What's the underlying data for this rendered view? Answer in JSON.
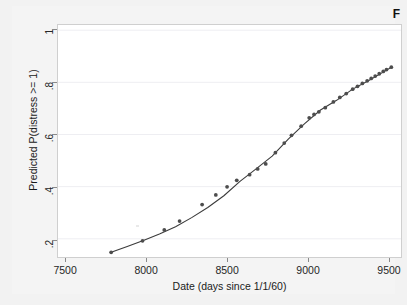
{
  "figure": {
    "background_color": "#f2f2f2",
    "plot_background_color": "#ffffff",
    "corner_glyph": "F"
  },
  "chart_data": {
    "type": "line",
    "title": "",
    "subtitle": "",
    "xlabel": "Date (days since 1/1/60)",
    "ylabel": "Predicted P(distress >= 1)",
    "xlim": [
      7450,
      9580
    ],
    "ylim": [
      0.13,
      1.02
    ],
    "xticks": [
      7500,
      8000,
      8500,
      9000,
      9500
    ],
    "xtick_labels": [
      "7500",
      "8000",
      "8500",
      "9000",
      "9500"
    ],
    "yticks": [
      0.2,
      0.4,
      0.6,
      0.8,
      1.0
    ],
    "ytick_labels": [
      ".2",
      ".4",
      ".6",
      ".8",
      "1"
    ],
    "grid": "horizontal",
    "grid_color": "#eeeef2",
    "legend": "none",
    "marker": "circle",
    "marker_color": "#4d4d4d",
    "line_color": "#3b3b3b",
    "series": [
      {
        "name": "Predicted P(distress >= 1)",
        "x": [
          7780,
          7975,
          8110,
          8205,
          8345,
          8430,
          8500,
          8560,
          8640,
          8690,
          8740,
          8800,
          8855,
          8900,
          8960,
          9010,
          9040,
          9070,
          9110,
          9160,
          9200,
          9240,
          9280,
          9310,
          9340,
          9370,
          9395,
          9420,
          9445,
          9470,
          9490,
          9520
        ],
        "y": [
          0.148,
          0.192,
          0.234,
          0.268,
          0.331,
          0.368,
          0.399,
          0.424,
          0.446,
          0.468,
          0.487,
          0.53,
          0.567,
          0.597,
          0.632,
          0.664,
          0.677,
          0.687,
          0.703,
          0.725,
          0.742,
          0.757,
          0.774,
          0.785,
          0.796,
          0.806,
          0.815,
          0.824,
          0.833,
          0.842,
          0.849,
          0.858
        ]
      }
    ],
    "fit_curve": {
      "name": "logistic fit",
      "x": [
        7780,
        7880,
        7980,
        8080,
        8180,
        8280,
        8380,
        8480,
        8580,
        8680,
        8780,
        8880,
        8980,
        9080,
        9180,
        9280,
        9380,
        9480,
        9520
      ],
      "y": [
        0.148,
        0.17,
        0.193,
        0.218,
        0.246,
        0.281,
        0.32,
        0.365,
        0.42,
        0.468,
        0.517,
        0.582,
        0.641,
        0.694,
        0.731,
        0.774,
        0.807,
        0.843,
        0.858
      ]
    }
  }
}
